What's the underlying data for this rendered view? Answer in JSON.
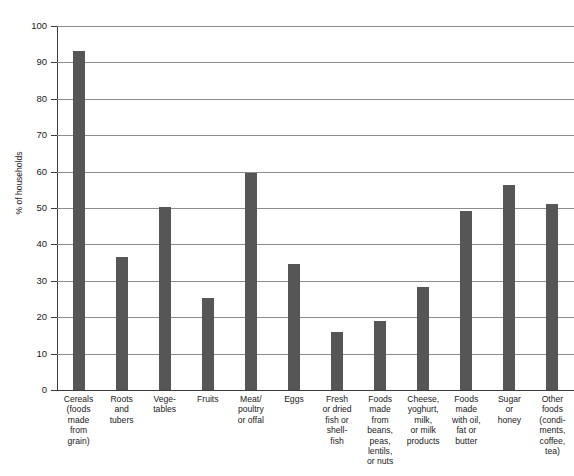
{
  "chart_data": {
    "type": "bar",
    "title": "",
    "title_visible_fragment": "",
    "xlabel": "",
    "ylabel": "% of households",
    "ylim": [
      0,
      100
    ],
    "ytick_step": 10,
    "ytick_labels": [
      "100",
      "90",
      "80",
      "70",
      "60",
      "50",
      "40",
      "30",
      "20",
      "10",
      "0"
    ],
    "ytick_values": [
      100,
      90,
      80,
      70,
      60,
      50,
      40,
      30,
      20,
      10,
      0
    ],
    "grid": "horizontal",
    "legend": "none",
    "bar_color": "#565656",
    "categories": [
      "Cereals\n(foods\nmade\nfrom\ngrain)",
      "Roots\nand\ntubers",
      "Vege-\ntables",
      "Fruits",
      "Meat/\npoultry\nor offal",
      "Eggs",
      "Fresh\nor dried\nfish or\nshell-\nfish",
      "Foods\nmade\nfrom\nbeans,\npeas,\nlentils,\nor nuts",
      "Cheese,\nyoghurt,\nmilk,\nor milk\nproducts",
      "Foods\nmade\nwith oil,\nfat or\nbutter",
      "Sugar\nor\nhoney",
      "Other\nfoods\n(condi-\nments,\ncoffee,\ntea)"
    ],
    "values": [
      93.0,
      36.5,
      50.3,
      25.3,
      59.5,
      34.5,
      15.9,
      19.0,
      28.2,
      49.3,
      56.3,
      51.0
    ]
  }
}
